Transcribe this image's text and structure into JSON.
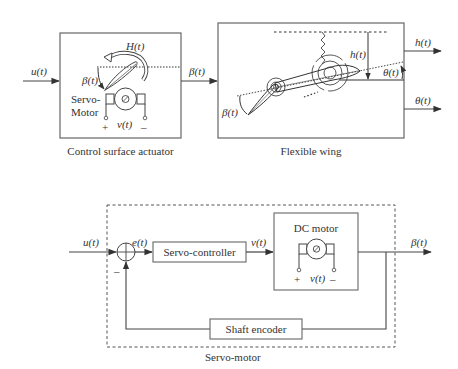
{
  "top_diagram": {
    "input_signal": "u(t)",
    "actuator_block": {
      "caption": "Control surface actuator",
      "hinge_moment_label": "H(t)",
      "deflection_label": "β(t)",
      "motor_label_line1": "Servo-",
      "motor_label_line2": "Motor",
      "voltage_label": "v(t)",
      "plus_terminal": "+",
      "minus_terminal": "–"
    },
    "link_signal": "β(t)",
    "wing_block": {
      "caption": "Flexible wing",
      "plunge_label": "h(t)",
      "pitch_label": "θ(t)",
      "flap_label": "β(t)"
    },
    "outputs": [
      "h(t)",
      "θ(t)"
    ]
  },
  "bottom_diagram": {
    "input_signal": "u(t)",
    "error_signal": "e(t)",
    "feedback_sign": "–",
    "controller_block": "Servo-controller",
    "control_signal": "v(t)",
    "motor_block": {
      "title": "DC motor",
      "voltage_label": "v(t)",
      "plus_terminal": "+",
      "minus_terminal": "–"
    },
    "output_signal": "β(t)",
    "encoder_block": "Shaft encoder",
    "enclosure_caption": "Servo-motor"
  },
  "colors": {
    "stroke": "#555555",
    "text": "#333333"
  }
}
